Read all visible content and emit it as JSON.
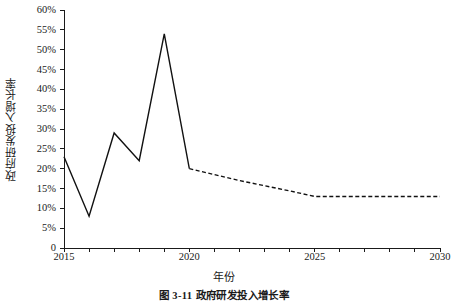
{
  "figure": {
    "caption": "图 3-11  政府研发投入增长率",
    "background_color": "#ffffff",
    "line_color": "#111111"
  },
  "chart_data": {
    "type": "line",
    "title": "",
    "xlabel": "年份",
    "ylabel": "政府研发投入增长率",
    "x": [
      2015,
      2016,
      2017,
      2018,
      2019,
      2020,
      2021,
      2022,
      2023,
      2024,
      2025,
      2026,
      2027,
      2028,
      2029,
      2030
    ],
    "xlim": [
      2015,
      2030
    ],
    "ylim": [
      0,
      60
    ],
    "grid": false,
    "legend": "none",
    "xtick_labels": [
      "2015",
      "2020",
      "2025",
      "2030"
    ],
    "xtick_values": [
      2015,
      2020,
      2025,
      2030
    ],
    "xminor_tick_values": [
      2016,
      2017,
      2018,
      2019,
      2021,
      2022,
      2023,
      2024,
      2026,
      2027,
      2028,
      2029
    ],
    "ytick_labels": [
      "0",
      "5%",
      "10%",
      "15%",
      "20%",
      "25%",
      "30%",
      "35%",
      "40%",
      "45%",
      "50%",
      "55%",
      "60%"
    ],
    "ytick_values": [
      0,
      5,
      10,
      15,
      20,
      25,
      30,
      35,
      40,
      45,
      50,
      55,
      60
    ],
    "series": [
      {
        "name": "历史值",
        "style": "solid",
        "x": [
          2015,
          2016,
          2017,
          2018,
          2019,
          2020
        ],
        "values": [
          23,
          8,
          29,
          22,
          54,
          20
        ]
      },
      {
        "name": "预测值",
        "style": "dashed",
        "x": [
          2020,
          2021,
          2022,
          2023,
          2024,
          2025,
          2026,
          2027,
          2028,
          2029,
          2030
        ],
        "values": [
          20,
          18.5,
          17,
          15.7,
          14.4,
          13,
          13,
          13,
          13,
          13,
          13
        ]
      }
    ]
  }
}
